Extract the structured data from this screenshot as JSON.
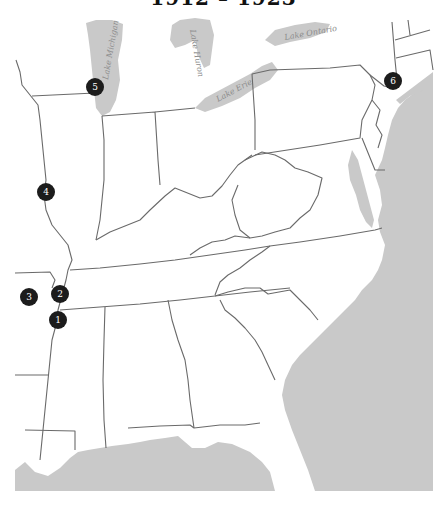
{
  "title": "1912 – 1923",
  "lakes": {
    "michigan": "Lake Michigan",
    "huron": "Lake Huron",
    "erie": "Lake Erie",
    "ontario": "Lake Ontario"
  },
  "markers": [
    {
      "number": "1",
      "x": 58,
      "y": 320
    },
    {
      "number": "2",
      "x": 60,
      "y": 294
    },
    {
      "number": "3",
      "x": 29,
      "y": 297
    },
    {
      "number": "4",
      "x": 46,
      "y": 192
    },
    {
      "number": "5",
      "x": 95,
      "y": 87
    },
    {
      "number": "6",
      "x": 393,
      "y": 81
    }
  ],
  "colors": {
    "water": "#c9c9c9",
    "land": "#ffffff",
    "border": "#6a6a6a",
    "marker": "#1c1c1c"
  }
}
